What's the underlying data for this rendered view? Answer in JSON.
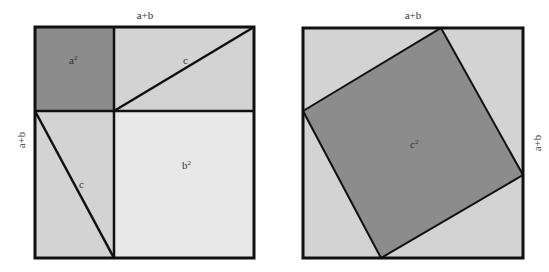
{
  "diagram": {
    "colors": {
      "dark_fill": "#8c8c8c",
      "mid_fill": "#d3d3d3",
      "light_fill": "#e8e8e8",
      "stroke": "#111111",
      "text": "#333333"
    },
    "left_figure": {
      "top_label": "a+b",
      "side_label": "a+b",
      "regions": {
        "a_squared": {
          "label": "a",
          "sup": "2"
        },
        "top_right_triangles": {
          "hypotenuse_label": "c"
        },
        "bottom_left_triangles": {
          "hypotenuse_label": "c"
        },
        "b_squared": {
          "label": "b",
          "sup": "2"
        }
      }
    },
    "right_figure": {
      "top_label": "a+b",
      "side_label": "a+b",
      "regions": {
        "c_squared": {
          "label": "c",
          "sup": "2"
        }
      }
    }
  }
}
